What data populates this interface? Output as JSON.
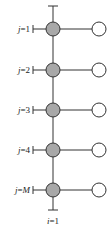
{
  "diagram": {
    "rows": [
      {
        "var": "j",
        "eq": "=1"
      },
      {
        "var": "j",
        "eq": "=2"
      },
      {
        "var": "j",
        "eq": "=3"
      },
      {
        "var": "j",
        "eq": "=4"
      },
      {
        "var": "j",
        "eq": "=",
        "sub": "M"
      }
    ],
    "bottom_label": {
      "var": "i",
      "eq": "=1"
    },
    "colors": {
      "filled_node": "#a8a8a8",
      "open_node": "#ffffff",
      "stroke": "#333333"
    }
  }
}
